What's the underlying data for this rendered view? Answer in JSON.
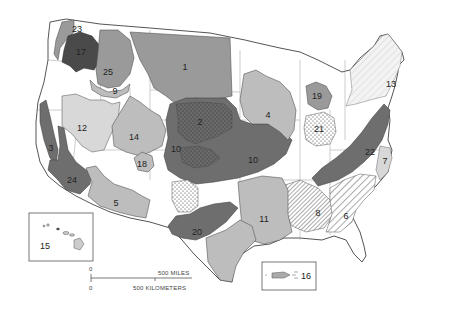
{
  "map": {
    "title": "",
    "colors": {
      "background": "#ffffff",
      "land": "#ffffff",
      "border": "#555555",
      "state_line": "#888888",
      "very_dark": "#4a4a4a",
      "dark": "#6e6e6e",
      "medium": "#9a9a9a",
      "light": "#bdbdbd",
      "very_light": "#d8d8d8"
    },
    "regions": [
      {
        "id": "1",
        "label": "1",
        "x": 185,
        "y": 67,
        "fill": "medium"
      },
      {
        "id": "2",
        "label": "2",
        "x": 200,
        "y": 122,
        "fill": "dark-stippled"
      },
      {
        "id": "3",
        "label": "3",
        "x": 51,
        "y": 148,
        "fill": "dark"
      },
      {
        "id": "4",
        "label": "4",
        "x": 268,
        "y": 115,
        "fill": "light"
      },
      {
        "id": "5",
        "label": "5",
        "x": 116,
        "y": 203,
        "fill": "light"
      },
      {
        "id": "6",
        "label": "6",
        "x": 346,
        "y": 216,
        "fill": "hatched"
      },
      {
        "id": "7",
        "label": "7",
        "x": 385,
        "y": 161,
        "fill": "very_light"
      },
      {
        "id": "8",
        "label": "8",
        "x": 318,
        "y": 213,
        "fill": "hatched-dense"
      },
      {
        "id": "9",
        "label": "9",
        "x": 115,
        "y": 91,
        "fill": "light"
      },
      {
        "id": "10a",
        "label": "10",
        "x": 176,
        "y": 149,
        "fill": "dark"
      },
      {
        "id": "10b",
        "label": "10",
        "x": 253,
        "y": 160,
        "fill": "dark"
      },
      {
        "id": "11",
        "label": "11",
        "x": 264,
        "y": 219,
        "fill": "light"
      },
      {
        "id": "12",
        "label": "12",
        "x": 82,
        "y": 128,
        "fill": "very_light"
      },
      {
        "id": "13",
        "label": "13",
        "x": 391,
        "y": 84,
        "fill": "very_light-hatched"
      },
      {
        "id": "14",
        "label": "14",
        "x": 134,
        "y": 137,
        "fill": "light"
      },
      {
        "id": "15",
        "label": "15",
        "x": 45,
        "y": 246,
        "fill": "inset"
      },
      {
        "id": "16",
        "label": "16",
        "x": 306,
        "y": 276,
        "fill": "inset"
      },
      {
        "id": "17",
        "label": "17",
        "x": 81,
        "y": 52,
        "fill": "very_dark"
      },
      {
        "id": "18",
        "label": "18",
        "x": 142,
        "y": 164,
        "fill": "light"
      },
      {
        "id": "19",
        "label": "19",
        "x": 317,
        "y": 96,
        "fill": "medium"
      },
      {
        "id": "20",
        "label": "20",
        "x": 197,
        "y": 232,
        "fill": "dark"
      },
      {
        "id": "21",
        "label": "21",
        "x": 319,
        "y": 129,
        "fill": "white-stippled"
      },
      {
        "id": "22",
        "label": "22",
        "x": 370,
        "y": 152,
        "fill": "dark"
      },
      {
        "id": "23",
        "label": "23",
        "x": 77,
        "y": 29,
        "fill": "light"
      },
      {
        "id": "24",
        "label": "24",
        "x": 72,
        "y": 180,
        "fill": "dark"
      },
      {
        "id": "25",
        "label": "25",
        "x": 108,
        "y": 72,
        "fill": "medium"
      }
    ],
    "insets": [
      {
        "id": "hawaii-inset",
        "label": "15",
        "x": 29,
        "y": 213,
        "w": 64,
        "h": 48
      },
      {
        "id": "puerto-rico-inset",
        "label": "16",
        "x": 262,
        "y": 262,
        "w": 54,
        "h": 28
      }
    ],
    "scale_bar": {
      "zero_miles": "0",
      "miles_label": "500 MILES",
      "zero_km": "0",
      "km_label": "500 KILOMETERS"
    }
  }
}
